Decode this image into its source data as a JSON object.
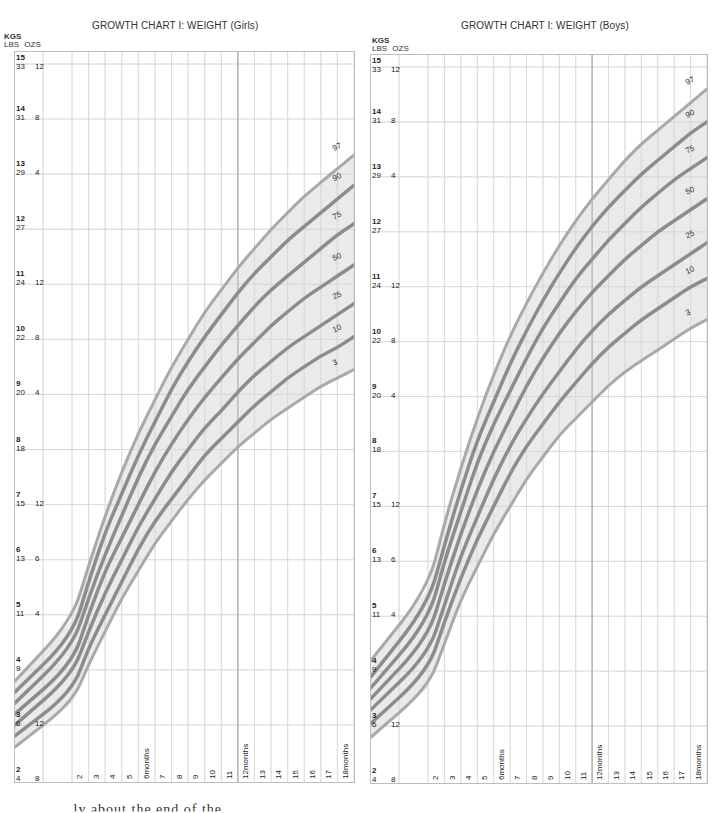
{
  "charts": [
    {
      "id": "girls",
      "title": "GROWTH CHART I: WEIGHT (Girls)",
      "axis_header": {
        "kgs": "KGS",
        "lbs": "LBS",
        "ozs": "OZS"
      },
      "y_labels": [
        {
          "kg": "15",
          "lbs": "33",
          "ozs": "12"
        },
        {
          "kg": "14",
          "lbs": "31",
          "ozs": "8"
        },
        {
          "kg": "13",
          "lbs": "29",
          "ozs": "4"
        },
        {
          "kg": "12",
          "lbs": "27",
          "ozs": ""
        },
        {
          "kg": "11",
          "lbs": "24",
          "ozs": "12"
        },
        {
          "kg": "10",
          "lbs": "22",
          "ozs": "8"
        },
        {
          "kg": "9",
          "lbs": "20",
          "ozs": "4"
        },
        {
          "kg": "8",
          "lbs": "18",
          "ozs": ""
        },
        {
          "kg": "7",
          "lbs": "15",
          "ozs": "12"
        },
        {
          "kg": "6",
          "lbs": "13",
          "ozs": "6"
        },
        {
          "kg": "5",
          "lbs": "11",
          "ozs": "4"
        },
        {
          "kg": "4",
          "lbs": "9",
          "ozs": ""
        },
        {
          "kg": "3",
          "lbs": "6",
          "ozs": "12"
        },
        {
          "kg": "2",
          "lbs": "4",
          "ozs": "8"
        }
      ],
      "x_labels": [
        "2",
        "3",
        "4",
        "5",
        "6months",
        "7",
        "8",
        "9",
        "10",
        "11",
        "12months",
        "13",
        "14",
        "15",
        "16",
        "17",
        "18months"
      ]
    },
    {
      "id": "boys",
      "title": "GROWTH CHART I: WEIGHT (Boys)",
      "axis_header": {
        "kgs": "KGS",
        "lbs": "LBS",
        "ozs": "OZS"
      },
      "y_labels": [
        {
          "kg": "15",
          "lbs": "33",
          "ozs": "12"
        },
        {
          "kg": "14",
          "lbs": "31",
          "ozs": "8"
        },
        {
          "kg": "13",
          "lbs": "29",
          "ozs": "4"
        },
        {
          "kg": "12",
          "lbs": "27",
          "ozs": ""
        },
        {
          "kg": "11",
          "lbs": "24",
          "ozs": "12"
        },
        {
          "kg": "10",
          "lbs": "22",
          "ozs": "8"
        },
        {
          "kg": "9",
          "lbs": "20",
          "ozs": "4"
        },
        {
          "kg": "8",
          "lbs": "18",
          "ozs": ""
        },
        {
          "kg": "7",
          "lbs": "15",
          "ozs": "12"
        },
        {
          "kg": "6",
          "lbs": "13",
          "ozs": "6"
        },
        {
          "kg": "5",
          "lbs": "11",
          "ozs": "4"
        },
        {
          "kg": "4",
          "lbs": "9",
          "ozs": ""
        },
        {
          "kg": "3",
          "lbs": "6",
          "ozs": "12"
        },
        {
          "kg": "2",
          "lbs": "4",
          "ozs": "8"
        }
      ],
      "x_labels": [
        "2",
        "3",
        "4",
        "5",
        "6months",
        "7",
        "8",
        "9",
        "10",
        "11",
        "12months",
        "13",
        "14",
        "15",
        "16",
        "17",
        "18months"
      ]
    }
  ],
  "footer_text": "...ly about the end of the ... ... ...",
  "chart_data": [
    {
      "type": "line",
      "title": "GROWTH CHART I: WEIGHT (Girls)",
      "xlabel": "Age (months)",
      "ylabel": "Weight (KGS / LBS OZS)",
      "x": [
        0,
        1,
        2,
        3,
        4,
        5,
        6,
        7,
        8,
        9,
        10,
        11,
        12,
        13,
        14,
        15,
        16,
        17,
        18
      ],
      "ylim": [
        2,
        15
      ],
      "xlim": [
        0,
        18
      ],
      "grid": true,
      "legend_position": "inline-right",
      "band_between": [
        "3",
        "97"
      ],
      "series": [
        {
          "name": "97",
          "values": [
            3.8,
            4.9,
            5.9,
            6.8,
            7.6,
            8.3,
            8.9,
            9.5,
            10.0,
            10.5,
            10.9,
            11.3,
            11.65,
            12.0,
            12.3,
            12.6,
            12.85,
            13.1,
            13.35
          ]
        },
        {
          "name": "90",
          "values": [
            3.6,
            4.6,
            5.6,
            6.5,
            7.2,
            7.9,
            8.5,
            9.1,
            9.6,
            10.05,
            10.45,
            10.85,
            11.2,
            11.5,
            11.8,
            12.05,
            12.3,
            12.55,
            12.8
          ]
        },
        {
          "name": "75",
          "values": [
            3.4,
            4.4,
            5.3,
            6.1,
            6.8,
            7.5,
            8.1,
            8.6,
            9.1,
            9.5,
            9.9,
            10.25,
            10.6,
            10.9,
            11.15,
            11.4,
            11.65,
            11.9,
            12.1
          ]
        },
        {
          "name": "50",
          "values": [
            3.2,
            4.1,
            5.0,
            5.8,
            6.4,
            7.0,
            7.6,
            8.1,
            8.55,
            8.95,
            9.3,
            9.65,
            9.95,
            10.25,
            10.5,
            10.75,
            10.95,
            11.15,
            11.35
          ]
        },
        {
          "name": "25",
          "values": [
            3.0,
            3.9,
            4.7,
            5.4,
            6.0,
            6.6,
            7.1,
            7.6,
            8.0,
            8.4,
            8.7,
            9.05,
            9.35,
            9.6,
            9.85,
            10.05,
            10.25,
            10.45,
            10.65
          ]
        },
        {
          "name": "10",
          "values": [
            2.8,
            3.6,
            4.4,
            5.0,
            5.6,
            6.2,
            6.7,
            7.1,
            7.5,
            7.9,
            8.2,
            8.5,
            8.8,
            9.05,
            9.3,
            9.5,
            9.7,
            9.85,
            10.05
          ]
        },
        {
          "name": "3",
          "values": [
            2.6,
            3.4,
            4.1,
            4.7,
            5.3,
            5.8,
            6.3,
            6.7,
            7.1,
            7.45,
            7.75,
            8.05,
            8.3,
            8.55,
            8.75,
            8.95,
            9.15,
            9.3,
            9.45
          ]
        }
      ]
    },
    {
      "type": "line",
      "title": "GROWTH CHART I: WEIGHT (Boys)",
      "xlabel": "Age (months)",
      "ylabel": "Weight (KGS / LBS OZS)",
      "x": [
        0,
        1,
        2,
        3,
        4,
        5,
        6,
        7,
        8,
        9,
        10,
        11,
        12,
        13,
        14,
        15,
        16,
        17,
        18
      ],
      "ylim": [
        2,
        15
      ],
      "xlim": [
        0,
        18
      ],
      "grid": true,
      "legend_position": "inline-right",
      "band_between": [
        "3",
        "97"
      ],
      "series": [
        {
          "name": "97",
          "values": [
            4.2,
            5.5,
            6.7,
            7.7,
            8.6,
            9.4,
            10.1,
            10.7,
            11.25,
            11.75,
            12.2,
            12.6,
            12.95,
            13.3,
            13.6,
            13.85,
            14.1,
            14.35,
            14.6
          ]
        },
        {
          "name": "90",
          "values": [
            3.9,
            5.2,
            6.3,
            7.3,
            8.2,
            8.9,
            9.6,
            10.2,
            10.75,
            11.25,
            11.7,
            12.1,
            12.45,
            12.75,
            13.05,
            13.3,
            13.55,
            13.8,
            14.0
          ]
        },
        {
          "name": "75",
          "values": [
            3.7,
            4.9,
            6.0,
            6.9,
            7.8,
            8.5,
            9.1,
            9.7,
            10.25,
            10.7,
            11.15,
            11.5,
            11.85,
            12.15,
            12.45,
            12.7,
            12.95,
            13.15,
            13.35
          ]
        },
        {
          "name": "50",
          "values": [
            3.5,
            4.6,
            5.6,
            6.5,
            7.3,
            8.0,
            8.6,
            9.2,
            9.7,
            10.15,
            10.55,
            10.9,
            11.2,
            11.5,
            11.75,
            12.0,
            12.2,
            12.4,
            12.6
          ]
        },
        {
          "name": "25",
          "values": [
            3.3,
            4.3,
            5.2,
            6.1,
            6.8,
            7.5,
            8.1,
            8.6,
            9.05,
            9.45,
            9.85,
            10.2,
            10.5,
            10.75,
            11.0,
            11.2,
            11.4,
            11.6,
            11.8
          ]
        },
        {
          "name": "10",
          "values": [
            3.05,
            4.0,
            4.9,
            5.7,
            6.4,
            7.0,
            7.6,
            8.1,
            8.5,
            8.9,
            9.25,
            9.6,
            9.9,
            10.15,
            10.4,
            10.6,
            10.8,
            11.0,
            11.15
          ]
        },
        {
          "name": "3",
          "values": [
            2.8,
            3.7,
            4.5,
            5.3,
            5.9,
            6.5,
            7.0,
            7.5,
            7.9,
            8.3,
            8.6,
            8.9,
            9.2,
            9.45,
            9.65,
            9.85,
            10.05,
            10.25,
            10.4
          ]
        }
      ]
    }
  ]
}
